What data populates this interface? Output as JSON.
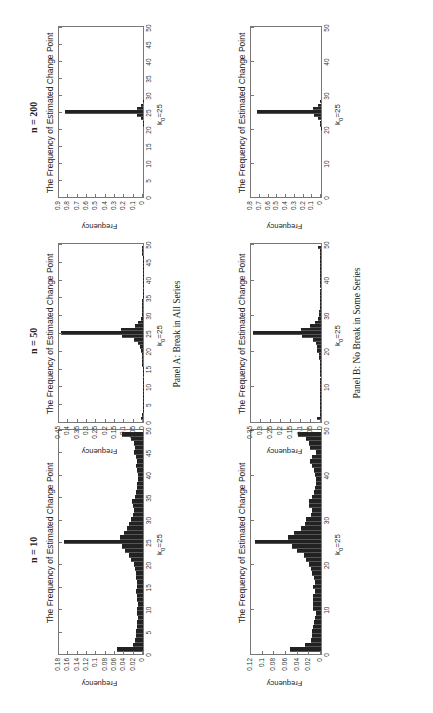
{
  "figure": {
    "orientation": "rotated 90 degrees counter-clockwise",
    "panel_captions": [
      "Panel A: Break in All Series",
      "Panel B: No Break in Some Series"
    ],
    "column_labels": [
      "n = 10",
      "n = 50",
      "n = 200"
    ]
  },
  "chart_data": [
    {
      "type": "bar",
      "panel": "Panel A: Break in All Series",
      "n_label": "n = 10",
      "title": "The Frequency of Estimated Change Point",
      "xlabel": "k0=25",
      "ylabel": "Frequency",
      "ylim": [
        0,
        0.18
      ],
      "yticks": [
        "0",
        "0.02",
        "0.04",
        "0.06",
        "0.08",
        "0.1",
        "0.12",
        "0.14",
        "0.16",
        "0.18"
      ],
      "xlim": [
        0,
        50
      ],
      "xticks": [
        "0",
        "5",
        "10",
        "15",
        "20",
        "25",
        "30",
        "35",
        "40",
        "45",
        "50"
      ],
      "grid": false,
      "x": [
        1,
        2,
        3,
        4,
        5,
        6,
        7,
        8,
        9,
        10,
        11,
        12,
        13,
        14,
        15,
        16,
        17,
        18,
        19,
        20,
        21,
        22,
        23,
        24,
        25,
        26,
        27,
        28,
        29,
        30,
        31,
        32,
        33,
        34,
        35,
        36,
        37,
        38,
        39,
        40,
        41,
        42,
        43,
        44,
        45,
        46,
        47,
        48,
        49
      ],
      "values": [
        0.055,
        0.022,
        0.018,
        0.015,
        0.014,
        0.013,
        0.012,
        0.011,
        0.012,
        0.013,
        0.011,
        0.012,
        0.013,
        0.014,
        0.013,
        0.012,
        0.014,
        0.016,
        0.018,
        0.02,
        0.025,
        0.03,
        0.038,
        0.045,
        0.17,
        0.05,
        0.04,
        0.035,
        0.03,
        0.025,
        0.022,
        0.02,
        0.022,
        0.024,
        0.018,
        0.015,
        0.013,
        0.012,
        0.01,
        0.01,
        0.012,
        0.014,
        0.012,
        0.015,
        0.02,
        0.018,
        0.02,
        0.025,
        0.045
      ]
    },
    {
      "type": "bar",
      "panel": "Panel A: Break in All Series",
      "n_label": "n = 50",
      "title": "The Frequency of Estimated Change Point",
      "xlabel": "k0=25",
      "ylabel": "Frequency",
      "ylim": [
        0,
        0.45
      ],
      "yticks": [
        "0",
        "0.05",
        "0.1",
        "0.15",
        "0.2",
        "0.25",
        "0.3",
        "0.35",
        "0.4",
        "0.45"
      ],
      "xlim": [
        0,
        50
      ],
      "xticks": [
        "0",
        "5",
        "10",
        "15",
        "20",
        "25",
        "30",
        "35",
        "40",
        "45",
        "50"
      ],
      "grid": false,
      "x": [
        1,
        2,
        3,
        4,
        5,
        6,
        7,
        8,
        9,
        10,
        11,
        12,
        13,
        14,
        15,
        16,
        17,
        18,
        19,
        20,
        21,
        22,
        23,
        24,
        25,
        26,
        27,
        28,
        29,
        30,
        31,
        32,
        33,
        34,
        35,
        36,
        37,
        38,
        39,
        40,
        41,
        42,
        43,
        44,
        45,
        46,
        47,
        48,
        49
      ],
      "values": [
        0.012,
        0.003,
        0.002,
        0.002,
        0.002,
        0.002,
        0.002,
        0.002,
        0.002,
        0.002,
        0.002,
        0.002,
        0.002,
        0.002,
        0.002,
        0.003,
        0.003,
        0.004,
        0.006,
        0.01,
        0.015,
        0.025,
        0.05,
        0.11,
        0.44,
        0.12,
        0.045,
        0.025,
        0.012,
        0.008,
        0.005,
        0.004,
        0.003,
        0.003,
        0.002,
        0.002,
        0.002,
        0.002,
        0.002,
        0.002,
        0.002,
        0.002,
        0.002,
        0.002,
        0.002,
        0.002,
        0.003,
        0.004,
        0.008
      ]
    },
    {
      "type": "bar",
      "panel": "Panel A: Break in All Series",
      "n_label": "n = 200",
      "title": "The Frequency of Estimated Change Point",
      "xlabel": "k0=25",
      "ylabel": "Frequency",
      "ylim": [
        0,
        0.9
      ],
      "yticks": [
        "0",
        "0.1",
        "0.2",
        "0.3",
        "0.4",
        "0.5",
        "0.6",
        "0.7",
        "0.8",
        "0.9"
      ],
      "xlim": [
        0,
        50
      ],
      "xticks": [
        "0",
        "5",
        "10",
        "15",
        "20",
        "25",
        "30",
        "35",
        "40",
        "45",
        "50"
      ],
      "grid": false,
      "x": [
        21,
        22,
        23,
        24,
        25,
        26,
        27,
        28
      ],
      "values": [
        0.002,
        0.005,
        0.02,
        0.06,
        0.84,
        0.06,
        0.02,
        0.005
      ]
    },
    {
      "type": "bar",
      "panel": "Panel B: No Break in Some Series",
      "n_label": "n = 10",
      "title": "The Frequency of Estimated Change Point",
      "xlabel": "k0=25",
      "ylabel": "Frequency",
      "ylim": [
        0,
        0.12
      ],
      "yticks": [
        "0",
        "0.02",
        "0.04",
        "0.06",
        "0.08",
        "0.1",
        "0.12"
      ],
      "xlim": [
        0,
        50
      ],
      "xticks": [
        "0",
        "10",
        "20",
        "30",
        "40",
        "50"
      ],
      "grid": false,
      "x": [
        1,
        2,
        3,
        4,
        5,
        6,
        7,
        8,
        9,
        10,
        11,
        12,
        13,
        14,
        15,
        16,
        17,
        18,
        19,
        20,
        21,
        22,
        23,
        24,
        25,
        26,
        27,
        28,
        29,
        30,
        31,
        32,
        33,
        34,
        35,
        36,
        37,
        38,
        39,
        40,
        41,
        42,
        43,
        44,
        45,
        46,
        47,
        48,
        49
      ],
      "values": [
        0.053,
        0.027,
        0.017,
        0.016,
        0.016,
        0.014,
        0.012,
        0.011,
        0.009,
        0.013,
        0.013,
        0.014,
        0.014,
        0.011,
        0.013,
        0.01,
        0.012,
        0.015,
        0.018,
        0.02,
        0.025,
        0.03,
        0.042,
        0.05,
        0.114,
        0.057,
        0.046,
        0.035,
        0.028,
        0.025,
        0.018,
        0.016,
        0.02,
        0.02,
        0.015,
        0.012,
        0.01,
        0.008,
        0.009,
        0.01,
        0.012,
        0.016,
        0.019,
        0.016,
        0.008,
        0.019,
        0.02,
        0.025,
        0.039
      ]
    },
    {
      "type": "bar",
      "panel": "Panel B: No Break in Some Series",
      "n_label": "n = 50",
      "title": "The Frequency of Estimated Change Point",
      "xlabel": "k0=25",
      "ylabel": "Frequency",
      "ylim": [
        0,
        0.35
      ],
      "yticks": [
        "0",
        "0.05",
        "0.1",
        "0.15",
        "0.2",
        "0.25",
        "0.3",
        "0.35"
      ],
      "xlim": [
        0,
        50
      ],
      "xticks": [
        "0",
        "10",
        "20",
        "30",
        "40",
        "50"
      ],
      "grid": false,
      "x": [
        1,
        2,
        3,
        4,
        5,
        6,
        7,
        8,
        9,
        10,
        11,
        12,
        13,
        14,
        15,
        16,
        17,
        18,
        19,
        20,
        21,
        22,
        23,
        24,
        25,
        26,
        27,
        28,
        29,
        30,
        31,
        32,
        33,
        34,
        35,
        36,
        37,
        38,
        39,
        40,
        41,
        42,
        43,
        44,
        45,
        46,
        47,
        48,
        49
      ],
      "values": [
        0.02,
        0.004,
        0.003,
        0.003,
        0.003,
        0.003,
        0.003,
        0.003,
        0.003,
        0.004,
        0.003,
        0.003,
        0.003,
        0.003,
        0.003,
        0.003,
        0.004,
        0.008,
        0.012,
        0.018,
        0.02,
        0.025,
        0.04,
        0.095,
        0.34,
        0.1,
        0.055,
        0.03,
        0.015,
        0.01,
        0.008,
        0.006,
        0.005,
        0.004,
        0.004,
        0.003,
        0.003,
        0.003,
        0.003,
        0.003,
        0.003,
        0.003,
        0.003,
        0.003,
        0.003,
        0.003,
        0.004,
        0.006,
        0.015
      ]
    },
    {
      "type": "bar",
      "panel": "Panel B: No Break in Some Series",
      "n_label": "n = 200",
      "title": "The Frequency of Estimated Change Point",
      "xlabel": "k0=25",
      "ylabel": "Frequency",
      "ylim": [
        0,
        0.8
      ],
      "yticks": [
        "0",
        "0.1",
        "0.2",
        "0.3",
        "0.4",
        "0.5",
        "0.6",
        "0.7",
        "0.8"
      ],
      "xlim": [
        0,
        50
      ],
      "xticks": [
        "0",
        "10",
        "20",
        "30",
        "40",
        "50"
      ],
      "grid": false,
      "x": [
        20,
        21,
        22,
        23,
        24,
        25,
        26,
        27,
        28
      ],
      "values": [
        0.003,
        0.008,
        0.015,
        0.03,
        0.08,
        0.73,
        0.09,
        0.03,
        0.008
      ]
    }
  ]
}
